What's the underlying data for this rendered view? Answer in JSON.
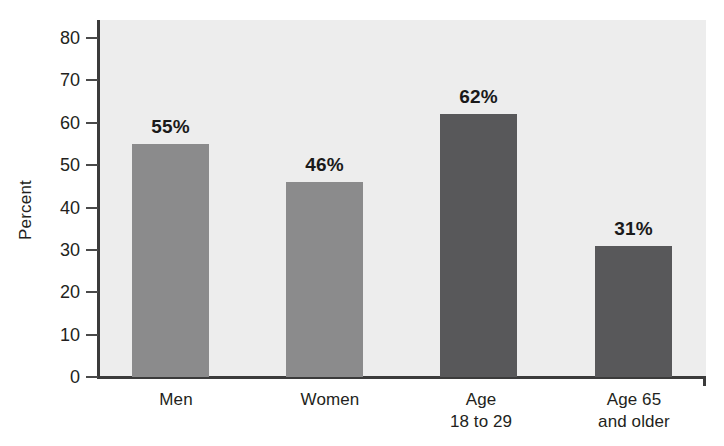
{
  "chart_data": {
    "type": "bar",
    "title": "",
    "xlabel": "",
    "ylabel": "Percent",
    "categories": [
      "Men",
      "Women",
      "Age\n18 to 29",
      "Age 65\nand older"
    ],
    "category_lines": [
      [
        "Men"
      ],
      [
        "Women"
      ],
      [
        "Age",
        "18 to 29"
      ],
      [
        "Age 65",
        "and older"
      ]
    ],
    "values": [
      55,
      46,
      62,
      31
    ],
    "value_labels": [
      "55%",
      "46%",
      "62%",
      "31%"
    ],
    "ylim": [
      0,
      80
    ],
    "yticks": [
      0,
      10,
      20,
      30,
      40,
      50,
      60,
      70,
      80
    ],
    "ytick_labels": [
      "0",
      "10",
      "20",
      "30",
      "40",
      "50",
      "60",
      "70",
      "80"
    ],
    "grid": false,
    "legend": "none",
    "bar_colors": [
      "#8b8b8c",
      "#8b8b8c",
      "#58585a",
      "#58585a"
    ],
    "plot_background": "#ededed",
    "axis_color": "#3b3b3b",
    "text_color": "#231f20"
  }
}
